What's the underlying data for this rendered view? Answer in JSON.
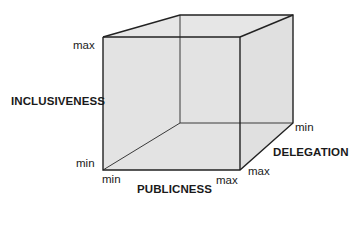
{
  "diagram": {
    "type": "3d-cube",
    "fill_color": "#e3e3e3",
    "edge_color": "#2a2a2a",
    "axes": {
      "vertical": {
        "name": "INCLUSIVENESS",
        "min_label": "min",
        "max_label": "max"
      },
      "horizontal": {
        "name": "PUBLICNESS",
        "min_label": "min",
        "max_label": "max"
      },
      "depth": {
        "name": "DELEGATION",
        "min_label": "min",
        "max_label": "max"
      }
    }
  }
}
